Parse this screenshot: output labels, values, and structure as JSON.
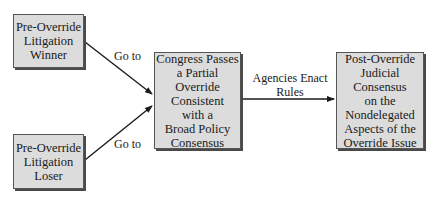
{
  "diagram": {
    "nodes": [
      {
        "id": "winner",
        "text": "Pre-Override\nLitigation\nWinner"
      },
      {
        "id": "loser",
        "text": "Pre-Override\nLitigation\nLoser"
      },
      {
        "id": "congress",
        "text": "Congress Passes\na Partial\nOverride\nConsistent\nwith a\nBroad Policy\nConsensus"
      },
      {
        "id": "consensus",
        "text": "Post-Override\nJudicial\nConsensus\non the\nNondelegated\nAspects of the\nOverride Issue"
      }
    ],
    "edges": [
      {
        "from": "winner",
        "to": "congress",
        "label": "Go to"
      },
      {
        "from": "loser",
        "to": "congress",
        "label": "Go to"
      },
      {
        "from": "congress",
        "to": "consensus",
        "label": "Agencies Enact\nRules"
      }
    ],
    "colors": {
      "box_fill": "#dcdcdc",
      "box_border": "#555555",
      "shadow": "#4a4a4a",
      "arrow": "#1a1a1a"
    }
  }
}
